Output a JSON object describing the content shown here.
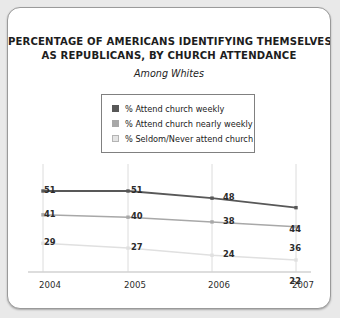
{
  "card": {
    "title_lines": [
      "PERCENTAGE OF AMERICANS IDENTIFYING THEMSELVES",
      "AS REPUBLICANS, BY CHURCH ATTENDANCE"
    ],
    "subtitle": "Among Whites"
  },
  "legend": {
    "entries": [
      {
        "label": "% Attend church weekly",
        "color": "#585858"
      },
      {
        "label": "% Attend church nearly weekly",
        "color": "#a8a8a8"
      },
      {
        "label": "% Seldom/Never attend church",
        "color": "#e4e4e4"
      }
    ]
  },
  "chart_data": {
    "type": "line",
    "title": "PERCENTAGE OF AMERICANS IDENTIFYING THEMSELVES AS REPUBLICANS, BY CHURCH ATTENDANCE",
    "subtitle": "Among Whites",
    "xlabel": "",
    "ylabel": "",
    "categories": [
      "2004",
      "2005",
      "2006",
      "2007"
    ],
    "ylim": [
      0,
      60
    ],
    "grid": "vertical",
    "legend_position": "top-center",
    "series": [
      {
        "name": "% Attend church weekly",
        "color": "#585858",
        "values": [
          51,
          51,
          48,
          44
        ],
        "labels": [
          "51",
          "51",
          "48",
          "44"
        ]
      },
      {
        "name": "% Attend church nearly weekly",
        "color": "#a8a8a8",
        "values": [
          41,
          40,
          38,
          36
        ],
        "labels": [
          "41",
          "40",
          "38",
          "36"
        ]
      },
      {
        "name": "% Seldom/Never attend church",
        "color": "#e0e0e0",
        "values": [
          29,
          27,
          24,
          22
        ],
        "labels": [
          "29",
          "27",
          "24",
          "22"
        ]
      }
    ]
  },
  "axis": {
    "tick_labels": [
      "2004",
      "2005",
      "2006",
      "2007"
    ]
  }
}
